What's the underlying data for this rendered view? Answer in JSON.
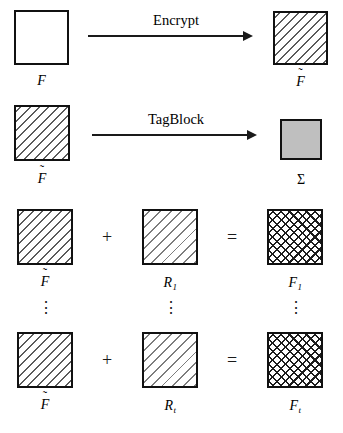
{
  "figure": {
    "type": "cryptographic-scheme-diagram",
    "colors": {
      "border": "#111111",
      "sigma_fill": "#bfbfbf",
      "hatch": "#5b5b5b",
      "background": "#ffffff"
    },
    "rows": [
      {
        "id": "encrypt-row",
        "operation_label": "Encrypt",
        "input_label": "F",
        "input_fill": "plain",
        "output_label": "F̃",
        "output_fill": "hatch-back"
      },
      {
        "id": "tagblock-row",
        "operation_label": "TagBlock",
        "input_label": "F̃",
        "input_fill": "hatch-back",
        "output_label": "Σ",
        "output_fill": "grey"
      },
      {
        "id": "combine-row-1",
        "left_label": "F̃",
        "left_fill": "hatch-back",
        "plus": "+",
        "middle_label_base": "R",
        "middle_label_sub": "1",
        "middle_fill": "hatch-fwd",
        "equals": "=",
        "right_label_base": "F",
        "right_label_sub": "1",
        "right_fill": "cross"
      },
      {
        "id": "combine-row-t",
        "left_label": "F̃",
        "left_fill": "hatch-back",
        "plus": "+",
        "middle_label_base": "R",
        "middle_label_sub": "t",
        "middle_fill": "hatch-fwd",
        "equals": "=",
        "right_label_base": "F",
        "right_label_sub": "t",
        "right_fill": "cross"
      }
    ],
    "ellipses": {
      "glyph": "⋮",
      "count": 3,
      "meaning": "rows 1 through t continue"
    },
    "tilde_glyph": "˜"
  }
}
